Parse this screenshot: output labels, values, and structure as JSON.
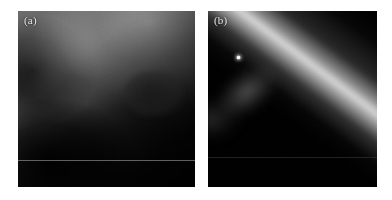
{
  "figure": {
    "background_color": "#ffffff",
    "width": 392,
    "height": 200,
    "panel_count": 2
  },
  "panels": [
    {
      "id": "a",
      "label": "(a)",
      "label_color": "#e8e8e8",
      "description": "Noisy grayscale image with a bright upper-right region fading into a dark lower-left region along a diagonal edge",
      "bounds": {
        "x": 18,
        "y": 11,
        "width": 177,
        "height": 176
      },
      "features": {
        "bright_region": "upper-right",
        "dark_region": "lower-left",
        "dark_blob": "right of centre",
        "horizontal_scanline_y_fraction": 0.845
      }
    },
    {
      "id": "b",
      "label": "(b)",
      "label_color": "#e8e8e8",
      "description": "Dark image with a bright diagonal streak running from lower-left to upper-right and a compact bright point source on the streak",
      "bounds": {
        "x": 208,
        "y": 11,
        "width": 169,
        "height": 176
      },
      "features": {
        "streak_angle_deg": 37,
        "point_source": {
          "x_fraction": 0.183,
          "y_fraction": 0.267,
          "color": "#ffffff"
        },
        "background_color": "#000000",
        "horizontal_scanline_y_fraction": 0.83
      }
    }
  ],
  "chart_data": {
    "type": "heatmap",
    "title": "",
    "xlabel": "",
    "ylabel": "",
    "panels": [
      {
        "name": "(a)",
        "colormap": "grayscale",
        "intensity_min": 0,
        "intensity_max": 255,
        "structure": "diagonal gradient, bright top-right to dark bottom-left"
      },
      {
        "name": "(b)",
        "colormap": "grayscale",
        "intensity_min": 0,
        "intensity_max": 255,
        "structure": "narrow bright diagonal band on dark background with one point source"
      }
    ]
  }
}
